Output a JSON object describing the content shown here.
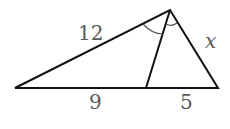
{
  "diagram": {
    "type": "triangle-angle-bisector",
    "vertices": {
      "left": [
        15,
        88
      ],
      "top": [
        170,
        10
      ],
      "foot": [
        146,
        88
      ],
      "right": [
        218,
        88
      ]
    },
    "labels": {
      "side_left": "12",
      "side_right": "x",
      "base_left": "9",
      "base_right": "5"
    },
    "stroke_color": "#111111",
    "label_color": "#5a5a5a"
  }
}
